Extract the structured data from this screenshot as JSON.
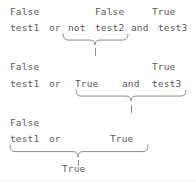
{
  "diagram": {
    "text_color": "#575757",
    "brace_color": "#8a8a8a",
    "background": "#ffffff",
    "steps": [
      {
        "id": "step-1",
        "values_line": {
          "tokens": [
            {
              "text": "False",
              "x": 10,
              "y": 6
            },
            {
              "text": "False",
              "x": 95,
              "y": 6
            },
            {
              "text": "True",
              "x": 152,
              "y": 6
            }
          ]
        },
        "expression_line": {
          "tokens": [
            {
              "text": "test1",
              "x": 10,
              "y": 22
            },
            {
              "text": "or",
              "x": 49,
              "y": 22
            },
            {
              "text": "not",
              "x": 68,
              "y": 22
            },
            {
              "text": "test2",
              "x": 95,
              "y": 22
            },
            {
              "text": "and",
              "x": 131,
              "y": 22
            },
            {
              "text": "test3",
              "x": 158,
              "y": 22
            }
          ]
        },
        "brace": {
          "left": 63,
          "right": 128,
          "tip": 95,
          "top": 34,
          "height": 11
        },
        "tick": {
          "x": 95,
          "top": 48,
          "height": 8
        }
      },
      {
        "id": "step-2",
        "values_line": {
          "tokens": [
            {
              "text": "False",
              "x": 10,
              "y": 61
            },
            {
              "text": "True",
              "x": 152,
              "y": 61
            }
          ]
        },
        "expression_line": {
          "tokens": [
            {
              "text": "test1",
              "x": 10,
              "y": 78
            },
            {
              "text": "or",
              "x": 49,
              "y": 78
            },
            {
              "text": "True",
              "x": 75,
              "y": 78
            },
            {
              "text": "and",
              "x": 122,
              "y": 78
            },
            {
              "text": "test3",
              "x": 152,
              "y": 78
            }
          ]
        },
        "brace": {
          "left": 76,
          "right": 186,
          "tip": 131,
          "top": 90,
          "height": 11
        },
        "tick": {
          "x": 131,
          "top": 105,
          "height": 8
        }
      },
      {
        "id": "step-3",
        "values_line": {
          "tokens": [
            {
              "text": "False",
              "x": 10,
              "y": 117
            }
          ]
        },
        "expression_line": {
          "tokens": [
            {
              "text": "test1",
              "x": 10,
              "y": 133
            },
            {
              "text": "or",
              "x": 49,
              "y": 133
            },
            {
              "text": "True",
              "x": 110,
              "y": 133
            }
          ]
        },
        "brace": {
          "left": 10,
          "right": 148,
          "tip": 78,
          "top": 145,
          "height": 12
        },
        "tick": {
          "x": 78,
          "top": 160,
          "height": 6
        }
      }
    ],
    "result": {
      "text": "True",
      "x": 62,
      "y": 163
    }
  }
}
